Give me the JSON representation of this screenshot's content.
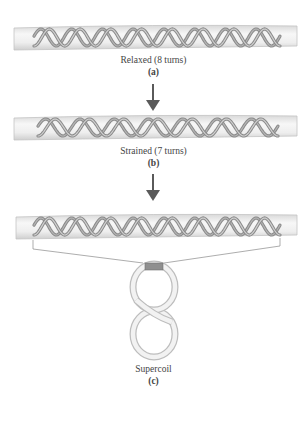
{
  "figure": {
    "panels": [
      {
        "id": "a",
        "caption": "Relaxed (8 turns)",
        "tag": "(a)",
        "turns": 8
      },
      {
        "id": "b",
        "caption": "Strained (7 turns)",
        "tag": "(b)",
        "turns": 7
      },
      {
        "id": "c",
        "caption": "Supercoil",
        "tag": "(c)",
        "shape": "figure-eight"
      }
    ],
    "arrows": [
      "down-arrow",
      "down-arrow"
    ],
    "colors": {
      "tube": "#e6e6e6",
      "tube_edge": "#bdbdbd",
      "strand": "#8a8a8a",
      "strand_light": "#b5b5b5",
      "arrow": "#5a5a5a",
      "unwound_patch": "#8f8f8f"
    }
  }
}
